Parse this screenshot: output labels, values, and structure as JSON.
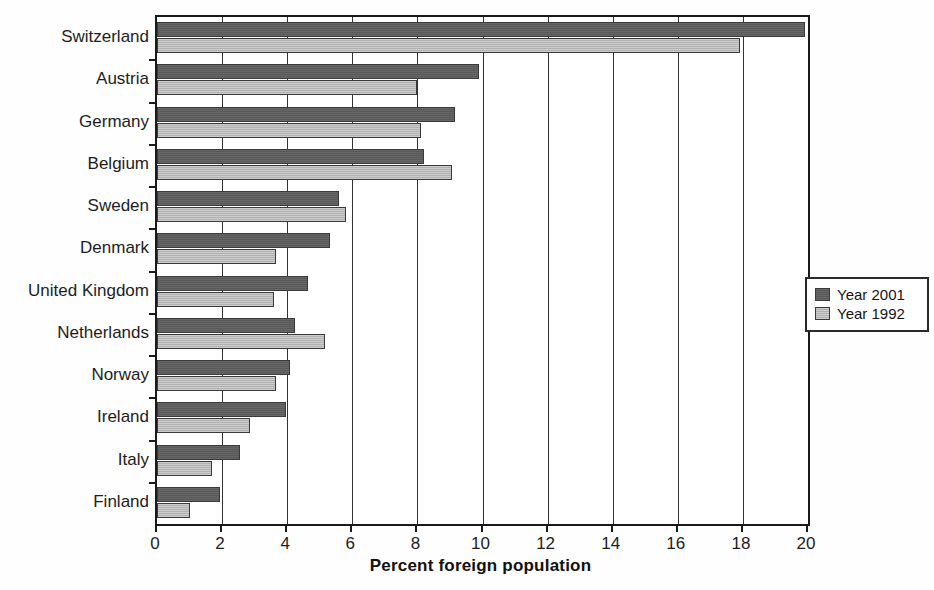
{
  "chart_data": {
    "type": "bar",
    "orientation": "horizontal",
    "title": "",
    "xlabel": "Percent foreign population",
    "ylabel": "",
    "xlim": [
      0,
      20
    ],
    "xticks": [
      0,
      2,
      4,
      6,
      8,
      10,
      12,
      14,
      16,
      18,
      20
    ],
    "xtick_labels": [
      "0",
      "2",
      "4",
      "6",
      "8",
      "10",
      "12",
      "14",
      "16",
      "18",
      "20"
    ],
    "grid": true,
    "grid_axis": "x",
    "legend_position": "right-outside",
    "categories": [
      "Switzerland",
      "Austria",
      "Germany",
      "Belgium",
      "Sweden",
      "Denmark",
      "United Kingdom",
      "Netherlands",
      "Norway",
      "Ireland",
      "Italy",
      "Finland"
    ],
    "series": [
      {
        "name": "Year 2001",
        "color": "#5e5e5e",
        "values": [
          19.9,
          9.9,
          9.15,
          8.2,
          5.6,
          5.3,
          4.65,
          4.25,
          4.1,
          3.95,
          2.55,
          1.95
        ]
      },
      {
        "name": "Year 1992",
        "color": "#bcbcbc",
        "values": [
          17.9,
          8.0,
          8.1,
          9.05,
          5.8,
          3.65,
          3.6,
          5.15,
          3.65,
          2.85,
          1.7,
          1.0
        ]
      }
    ]
  },
  "legend": {
    "items": [
      {
        "label": "Year 2001",
        "swatch": "recent"
      },
      {
        "label": "Year 1992",
        "swatch": "older"
      }
    ]
  },
  "axis": {
    "x_title": "Percent foreign population"
  }
}
